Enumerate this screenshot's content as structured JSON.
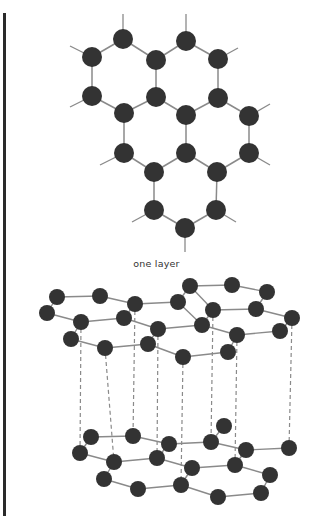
{
  "colors": {
    "atom": "#333333",
    "bond": "#8a8a8a",
    "dash": "#8a8a8a",
    "border": "#2a2a2a"
  },
  "caption": "one layer",
  "flat_layer": {
    "atom_radius": 10,
    "atoms": [
      [
        123,
        39
      ],
      [
        186,
        41
      ],
      [
        92,
        57
      ],
      [
        156,
        60
      ],
      [
        218,
        59
      ],
      [
        92,
        96
      ],
      [
        156,
        97
      ],
      [
        218,
        98
      ],
      [
        124,
        113
      ],
      [
        186,
        115
      ],
      [
        249,
        116
      ],
      [
        124,
        153
      ],
      [
        186,
        153
      ],
      [
        249,
        153
      ],
      [
        154,
        172
      ],
      [
        217,
        172
      ],
      [
        154,
        210
      ],
      [
        216,
        210
      ],
      [
        185,
        228
      ]
    ],
    "bonds": [
      [
        0,
        2
      ],
      [
        0,
        3
      ],
      [
        1,
        3
      ],
      [
        1,
        4
      ],
      [
        2,
        5
      ],
      [
        3,
        6
      ],
      [
        4,
        7
      ],
      [
        5,
        8
      ],
      [
        6,
        8
      ],
      [
        6,
        9
      ],
      [
        7,
        9
      ],
      [
        7,
        10
      ],
      [
        8,
        11
      ],
      [
        9,
        12
      ],
      [
        10,
        13
      ],
      [
        11,
        14
      ],
      [
        12,
        14
      ],
      [
        12,
        15
      ],
      [
        13,
        15
      ],
      [
        14,
        16
      ],
      [
        15,
        17
      ],
      [
        16,
        18
      ],
      [
        17,
        18
      ]
    ],
    "stubs": [
      [
        123,
        39,
        123,
        14
      ],
      [
        186,
        41,
        186,
        14
      ],
      [
        92,
        57,
        70,
        46
      ],
      [
        218,
        59,
        238,
        48
      ],
      [
        92,
        96,
        70,
        107
      ],
      [
        249,
        116,
        270,
        104
      ],
      [
        124,
        153,
        100,
        165
      ],
      [
        249,
        153,
        270,
        165
      ],
      [
        154,
        210,
        132,
        222
      ],
      [
        216,
        210,
        236,
        222
      ],
      [
        185,
        228,
        185,
        252
      ]
    ]
  },
  "stacked": {
    "atom_radius": 8,
    "top_layer": {
      "atoms": [
        [
          57,
          297
        ],
        [
          100,
          296
        ],
        [
          135,
          304
        ],
        [
          178,
          302
        ],
        [
          190,
          286
        ],
        [
          232,
          285
        ],
        [
          267,
          292
        ],
        [
          47,
          313
        ],
        [
          81,
          322
        ],
        [
          124,
          318
        ],
        [
          158,
          329
        ],
        [
          202,
          325
        ],
        [
          213,
          310
        ],
        [
          256,
          309
        ],
        [
          292,
          318
        ],
        [
          71,
          339
        ],
        [
          105,
          348
        ],
        [
          148,
          344
        ],
        [
          183,
          357
        ],
        [
          228,
          352
        ],
        [
          237,
          335
        ],
        [
          280,
          331
        ]
      ],
      "bonds": [
        [
          0,
          1
        ],
        [
          1,
          2
        ],
        [
          2,
          3
        ],
        [
          3,
          4
        ],
        [
          4,
          5
        ],
        [
          5,
          6
        ],
        [
          0,
          7
        ],
        [
          7,
          8
        ],
        [
          8,
          9
        ],
        [
          2,
          9
        ],
        [
          9,
          10
        ],
        [
          10,
          11
        ],
        [
          3,
          11
        ],
        [
          11,
          12
        ],
        [
          4,
          12
        ],
        [
          12,
          13
        ],
        [
          13,
          14
        ],
        [
          6,
          13
        ],
        [
          8,
          15
        ],
        [
          15,
          16
        ],
        [
          16,
          17
        ],
        [
          17,
          10
        ],
        [
          17,
          18
        ],
        [
          18,
          19
        ],
        [
          19,
          20
        ],
        [
          20,
          11
        ],
        [
          20,
          21
        ],
        [
          21,
          14
        ]
      ]
    },
    "bottom_layer": {
      "atoms": [
        [
          91,
          437
        ],
        [
          133,
          436
        ],
        [
          169,
          444
        ],
        [
          211,
          442
        ],
        [
          224,
          426
        ],
        [
          246,
          450
        ],
        [
          289,
          448
        ],
        [
          80,
          453
        ],
        [
          114,
          462
        ],
        [
          157,
          458
        ],
        [
          192,
          468
        ],
        [
          235,
          465
        ],
        [
          270,
          475
        ],
        [
          104,
          479
        ],
        [
          138,
          489
        ],
        [
          181,
          485
        ],
        [
          218,
          497
        ],
        [
          261,
          493
        ]
      ],
      "bonds": [
        [
          0,
          1
        ],
        [
          1,
          2
        ],
        [
          2,
          3
        ],
        [
          3,
          4
        ],
        [
          3,
          5
        ],
        [
          5,
          6
        ],
        [
          0,
          7
        ],
        [
          7,
          8
        ],
        [
          8,
          9
        ],
        [
          9,
          2
        ],
        [
          9,
          10
        ],
        [
          10,
          11
        ],
        [
          11,
          5
        ],
        [
          11,
          12
        ],
        [
          8,
          13
        ],
        [
          13,
          14
        ],
        [
          14,
          15
        ],
        [
          15,
          10
        ],
        [
          15,
          16
        ],
        [
          16,
          17
        ],
        [
          17,
          12
        ]
      ]
    },
    "dashed_x": [
      81,
      105,
      135,
      158,
      183,
      213,
      237,
      292
    ],
    "dashed_pairs": [
      [
        81,
        322,
        80,
        453
      ],
      [
        105,
        348,
        114,
        462
      ],
      [
        135,
        304,
        133,
        436
      ],
      [
        158,
        329,
        157,
        458
      ],
      [
        183,
        357,
        181,
        485
      ],
      [
        213,
        310,
        211,
        442
      ],
      [
        237,
        335,
        235,
        465
      ],
      [
        292,
        318,
        289,
        448
      ]
    ]
  }
}
